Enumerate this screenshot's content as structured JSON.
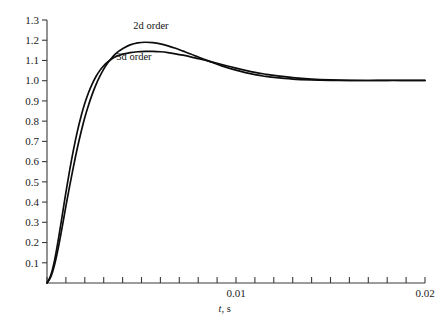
{
  "chart_data": {
    "type": "line",
    "title": "",
    "subtitle": "",
    "xlabel": "t, s",
    "ylabel": "",
    "xlim": [
      0,
      0.02
    ],
    "ylim": [
      0,
      1.3
    ],
    "grid": false,
    "legend_position": "inline-annotations",
    "x_ticks": [
      0,
      0.001,
      0.002,
      0.003,
      0.004,
      0.005,
      0.006,
      0.007,
      0.008,
      0.009,
      0.01,
      0.011,
      0.012,
      0.013,
      0.014,
      0.015,
      0.016,
      0.017,
      0.018,
      0.019,
      0.02
    ],
    "x_tick_labels": [
      "",
      "",
      "",
      "",
      "",
      "",
      "",
      "",
      "",
      "",
      "0.01",
      "",
      "",
      "",
      "",
      "",
      "",
      "",
      "",
      "",
      "0.02"
    ],
    "y_ticks": [
      0,
      0.1,
      0.2,
      0.3,
      0.4,
      0.5,
      0.6,
      0.7,
      0.8,
      0.9,
      1.0,
      1.1,
      1.2,
      1.3
    ],
    "y_tick_labels": [
      "",
      "0.1",
      "0.2",
      "0.3",
      "0.4",
      "0.5",
      "0.6",
      "0.7",
      "0.8",
      "0.9",
      "1.0",
      "1.1",
      "1.2",
      "1.3"
    ],
    "annotations": [
      {
        "text": "2d order",
        "x": 0.0055,
        "y": 1.255
      },
      {
        "text": "3d order",
        "x": 0.0046,
        "y": 1.1
      }
    ],
    "series": [
      {
        "name": "2d order",
        "color": "#0d0d0d",
        "x": [
          0.0,
          0.0002,
          0.0004,
          0.0006,
          0.0008,
          0.001,
          0.0012,
          0.0014,
          0.0016,
          0.0018,
          0.002,
          0.0022,
          0.0024,
          0.0026,
          0.0028,
          0.003,
          0.0032,
          0.0034,
          0.0036,
          0.0038,
          0.004,
          0.0044,
          0.0048,
          0.0052,
          0.0056,
          0.006,
          0.0064,
          0.0068,
          0.0072,
          0.0076,
          0.008,
          0.0085,
          0.009,
          0.0095,
          0.01,
          0.0105,
          0.011,
          0.0115,
          0.012,
          0.013,
          0.014,
          0.015,
          0.016,
          0.017,
          0.018,
          0.019,
          0.02
        ],
        "y": [
          0.0,
          0.03,
          0.09,
          0.175,
          0.275,
          0.38,
          0.48,
          0.575,
          0.665,
          0.745,
          0.818,
          0.88,
          0.935,
          0.982,
          1.022,
          1.057,
          1.086,
          1.11,
          1.13,
          1.146,
          1.158,
          1.177,
          1.187,
          1.19,
          1.188,
          1.182,
          1.172,
          1.16,
          1.146,
          1.132,
          1.117,
          1.099,
          1.082,
          1.066,
          1.052,
          1.04,
          1.03,
          1.022,
          1.016,
          1.008,
          1.004,
          1.002,
          1.001,
          1.001,
          1.002,
          1.002,
          1.002
        ]
      },
      {
        "name": "3d order",
        "color": "#0d0d0d",
        "x": [
          0.0,
          0.0002,
          0.0004,
          0.0006,
          0.0008,
          0.001,
          0.0012,
          0.0014,
          0.0016,
          0.0018,
          0.002,
          0.0022,
          0.0024,
          0.0026,
          0.0028,
          0.003,
          0.0032,
          0.0034,
          0.0036,
          0.0038,
          0.004,
          0.0044,
          0.0048,
          0.0052,
          0.0056,
          0.006,
          0.0064,
          0.0068,
          0.0072,
          0.0076,
          0.008,
          0.0085,
          0.009,
          0.0095,
          0.01,
          0.0105,
          0.011,
          0.0115,
          0.012,
          0.013,
          0.014,
          0.015,
          0.016,
          0.017,
          0.018,
          0.019,
          0.02
        ],
        "y": [
          0.0,
          0.038,
          0.112,
          0.215,
          0.33,
          0.448,
          0.558,
          0.658,
          0.747,
          0.823,
          0.888,
          0.942,
          0.986,
          1.022,
          1.051,
          1.074,
          1.092,
          1.106,
          1.117,
          1.125,
          1.131,
          1.139,
          1.143,
          1.145,
          1.145,
          1.143,
          1.139,
          1.133,
          1.126,
          1.118,
          1.109,
          1.098,
          1.086,
          1.074,
          1.062,
          1.051,
          1.041,
          1.033,
          1.026,
          1.015,
          1.008,
          1.004,
          1.002,
          1.001,
          1.001,
          1.001,
          1.001
        ]
      }
    ]
  },
  "figure": {
    "background_color": "#ffffff",
    "axis_color": "#3a3a3a",
    "curve_color": "#0d0d0d"
  }
}
